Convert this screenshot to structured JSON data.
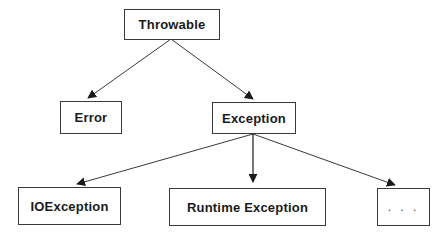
{
  "diagram": {
    "type": "class-hierarchy",
    "nodes": {
      "throwable": {
        "label": "Throwable"
      },
      "error": {
        "label": "Error"
      },
      "exception": {
        "label": "Exception"
      },
      "ioexception": {
        "label": "IOException"
      },
      "runtime": {
        "label": "Runtime Exception"
      },
      "more": {
        "label": ". . ."
      }
    },
    "edges": [
      {
        "from": "Throwable",
        "to": "Error"
      },
      {
        "from": "Throwable",
        "to": "Exception"
      },
      {
        "from": "Exception",
        "to": "IOException"
      },
      {
        "from": "Exception",
        "to": "Runtime Exception"
      },
      {
        "from": "Exception",
        "to": "..."
      }
    ],
    "colors": {
      "line": "#3a3a3a",
      "border": "#3a3a3a",
      "text": "#1a1a1a",
      "background": "#ffffff"
    }
  }
}
